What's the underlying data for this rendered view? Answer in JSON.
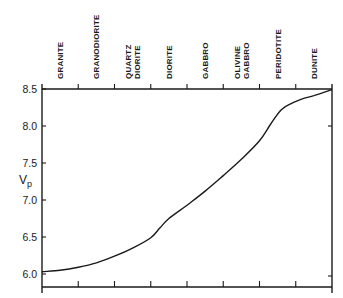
{
  "chart_data": {
    "type": "line",
    "title": "",
    "xlabel": "",
    "ylabel": "V",
    "ylabel_subscript": "p",
    "ylim": [
      5.83,
      8.5
    ],
    "yticks": [
      6.0,
      6.5,
      7.0,
      7.5,
      8.0,
      8.5
    ],
    "ytick_labels": [
      "6.0",
      "6.5",
      "7.0",
      "7.5",
      "8.0",
      "8.5"
    ],
    "grid": false,
    "legend": "none",
    "categories": [
      [
        "GRANITE"
      ],
      [
        "GRANODIORITE"
      ],
      [
        "QUARTZ",
        "DIORITE"
      ],
      [
        "DIORITE"
      ],
      [
        "GABBRO"
      ],
      [
        "OLIVINE",
        "GABBRO"
      ],
      [
        "PERIDOTITE"
      ],
      [
        "DUNITE"
      ]
    ],
    "category_axis_position": "top",
    "xlim": [
      0,
      8
    ],
    "series": [
      {
        "name": "Vp",
        "x": [
          0.0,
          0.5,
          1.0,
          1.5,
          2.0,
          2.5,
          3.0,
          3.25,
          3.5,
          4.0,
          4.5,
          5.0,
          5.5,
          6.0,
          6.3,
          6.6,
          6.9,
          7.2,
          7.5,
          8.0
        ],
        "y": [
          6.03,
          6.05,
          6.09,
          6.15,
          6.24,
          6.35,
          6.49,
          6.62,
          6.75,
          6.93,
          7.12,
          7.33,
          7.55,
          7.8,
          8.02,
          8.22,
          8.31,
          8.37,
          8.41,
          8.49
        ]
      }
    ]
  }
}
